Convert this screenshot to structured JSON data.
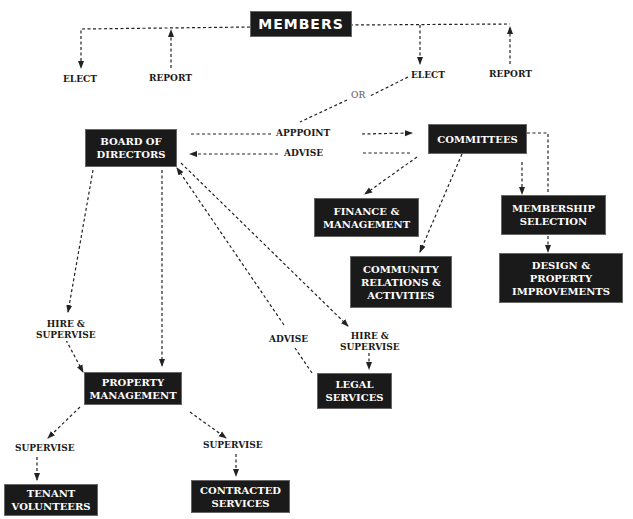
{
  "diagram": {
    "title": "MEMBERS",
    "nodes": {
      "members": "MEMBERS",
      "board": "BOARD OF\nDIRECTORS",
      "committees": "COMMITTEES",
      "finance": "FINANCE &\nMANAGEMENT",
      "community": "COMMUNITY\nRELATIONS &\nACTIVITIES",
      "membership": "MEMBERSHIP\nSELECTION",
      "design": "DESIGN &\nPROPERTY\nIMPROVEMENTS",
      "property": "PROPERTY\nMANAGEMENT",
      "legal": "LEGAL\nSERVICES",
      "tenant": "TENANT\nVOLUNTEERS",
      "contracted": "CONTRACTED\nSERVICES"
    },
    "labels": {
      "elect_left": "ELECT",
      "report_left": "REPORT",
      "elect_right": "ELECT",
      "report_right": "REPORT",
      "or": "OR",
      "appoint": "APPPOINT",
      "advise_top": "ADVISE",
      "hire_supervise_left": "HIRE &\nSUPERVISE",
      "advise_legal": "ADVISE",
      "hire_supervise_legal": "HIRE &\nSUPERVISE",
      "supervise_tenant": "SUPERVISE",
      "supervise_contracted": "SUPERVISE"
    },
    "colors": {
      "box": "#1a1a1a",
      "box_text": "#ffffff",
      "line": "#222222"
    }
  }
}
